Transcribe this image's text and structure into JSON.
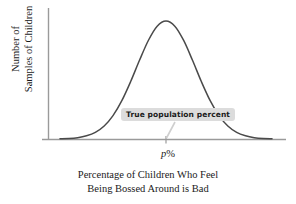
{
  "figure": {
    "type": "line",
    "background_color": "#ffffff",
    "curve_color": "#4a4a4a",
    "axis_color": "#9a9a9a",
    "callout_background_color": "#dcdcdc",
    "callout_text_color": "#1a1a1a",
    "leader_line_color": "#cccccc"
  },
  "y_axis": {
    "title_line_1": "Number of",
    "title_line_2": "Samples of Children"
  },
  "x_axis": {
    "caption_line_1": "Percentage of Children Who Feel",
    "caption_line_2": "Being Bossed Around is Bad",
    "tick_label_symbol": "p",
    "tick_label_unit": "%"
  },
  "annotation": {
    "callout_label": "True population percent"
  },
  "chart_data": {
    "type": "line",
    "title": "",
    "subtitle": "",
    "xlabel": "Percentage of Children Who Feel Being Bossed Around is Bad",
    "ylabel": "Number of Samples of Children",
    "grid": false,
    "legend": "none",
    "axis_tick_labels": {
      "x": [
        "p %"
      ],
      "y": []
    },
    "annotations": [
      {
        "text": "True population percent",
        "points_to_x_tick": "p %",
        "style": "gray rounded box with leader line to axis tick"
      }
    ],
    "distribution": {
      "shape": "normal",
      "mean_label": "p %",
      "mean_x": 0,
      "std_dev": 1,
      "peak_relative_height": 1.0
    },
    "xlim": [
      -3.6,
      3.6
    ],
    "ylim": [
      0,
      1.08
    ],
    "x": [
      -3.6,
      -3.3,
      -3.0,
      -2.7,
      -2.4,
      -2.1,
      -1.8,
      -1.5,
      -1.2,
      -0.9,
      -0.6,
      -0.3,
      0.0,
      0.3,
      0.6,
      0.9,
      1.2,
      1.5,
      1.8,
      2.1,
      2.4,
      2.7,
      3.0,
      3.3,
      3.6
    ],
    "y": [
      0.002,
      0.004,
      0.011,
      0.027,
      0.056,
      0.11,
      0.198,
      0.325,
      0.487,
      0.667,
      0.835,
      0.956,
      1.0,
      0.956,
      0.835,
      0.667,
      0.487,
      0.325,
      0.198,
      0.11,
      0.056,
      0.027,
      0.011,
      0.004,
      0.002
    ]
  }
}
